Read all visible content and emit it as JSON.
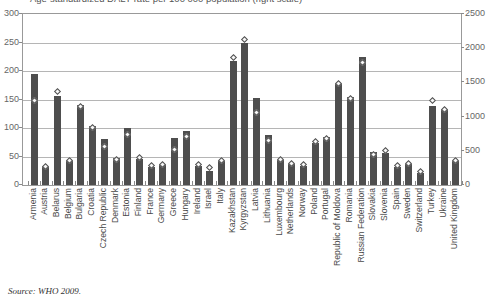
{
  "figure": {
    "title_fragment": "Age-standardized DALY rate per 100 000 population (right scale)",
    "source": "Source: WHO 2009."
  },
  "chart_data": {
    "type": "bar",
    "title": "Age-standardized DALY rate per 100 000 population (right scale)",
    "xlabel": "",
    "ylabel": "",
    "grid": "horizontal",
    "legend_position": "none",
    "left_axis": {
      "range": [
        0,
        300
      ],
      "ticks": [
        0,
        50,
        100,
        150,
        200,
        250,
        300
      ]
    },
    "right_axis": {
      "range": [
        0,
        2500
      ],
      "ticks": [
        0,
        500,
        1000,
        1500,
        2000,
        2500
      ]
    },
    "categories": [
      "Armenia",
      "Austria",
      "Belarus",
      "Belgium",
      "Bulgaria",
      "Croatia",
      "Czech Republic",
      "Denmark",
      "Estonia",
      "Finland",
      "France",
      "Germany",
      "Greece",
      "Hungary",
      "Ireland",
      "Israel",
      "Italy",
      "Kazakhstan",
      "Kyrgyzstan",
      "Latvia",
      "Lithuania",
      "Luxembourg",
      "Netherlands",
      "Norway",
      "Poland",
      "Portugal",
      "Republic of Moldova",
      "Romania",
      "Russian Federation",
      "Slovakia",
      "Slovenia",
      "Spain",
      "Sweden",
      "Switzerland",
      "Turkey",
      "Ukraine",
      "United Kingdom"
    ],
    "series": [
      {
        "name": "Rate per 100 000 (bars, left scale)",
        "marker": "bar",
        "axis": "left",
        "values": [
          195,
          34,
          157,
          44,
          141,
          103,
          80,
          47,
          100,
          46,
          31,
          37,
          82,
          94,
          34,
          25,
          42,
          218,
          250,
          153,
          87,
          44,
          36,
          34,
          73,
          84,
          179,
          154,
          225,
          58,
          56,
          32,
          36,
          21,
          139,
          134,
          42
        ]
      },
      {
        "name": "Age-standardized DALY rate per 100 000 population (diamonds, right scale)",
        "marker": "diamond",
        "axis": "right",
        "values": [
          1230,
          265,
          1360,
          360,
          1150,
          835,
          565,
          375,
          735,
          400,
          285,
          300,
          525,
          710,
          300,
          250,
          365,
          1870,
          2125,
          1060,
          650,
          375,
          310,
          300,
          635,
          685,
          1485,
          1260,
          1785,
          450,
          510,
          290,
          315,
          200,
          1235,
          1100,
          365
        ]
      }
    ]
  },
  "colors": {
    "bar": "#4e4e4e",
    "diamond_fill": "#f7f7f7",
    "diamond_border": "#4e4e4e",
    "gridline": "#b5b5b5",
    "plot_border": "#999999",
    "axis_text": "#666666"
  }
}
